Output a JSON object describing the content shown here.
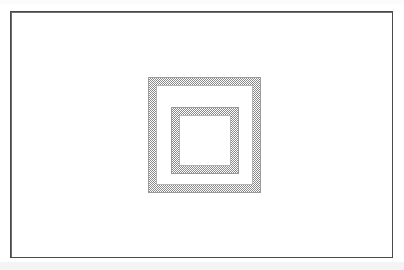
{
  "figure": {
    "title": "",
    "caption": "",
    "background_color": "#ffffff",
    "canvas": {
      "width": 404,
      "height": 270
    }
  },
  "frame": {
    "name": "figure-border",
    "x": 10,
    "y": 11,
    "width": 383,
    "height": 247,
    "stroke_color": "#4a4a4a",
    "stroke_width": 1,
    "fill_color": "#ffffff"
  },
  "artifacts": {
    "top_band_color": "#fbfbfb",
    "bottom_band_color": "#f4f4f4"
  },
  "shapes": [
    {
      "name": "outer-square",
      "type": "square-ring",
      "x": 148,
      "y": 77,
      "width": 113,
      "height": 116,
      "border_thickness": 7,
      "fill_pattern": "dithered-gray-halftone",
      "fill_color": "#8a8a8a",
      "stroke_color": "#9a9a9a",
      "interior_fill": "#ffffff"
    },
    {
      "name": "inner-square",
      "type": "square-ring",
      "x": 171,
      "y": 107,
      "width": 68,
      "height": 67,
      "border_thickness": 7,
      "fill_pattern": "dithered-gray-halftone",
      "fill_color": "#8a8a8a",
      "stroke_color": "#9a9a9a",
      "interior_fill": "#ffffff"
    }
  ],
  "chart_data": {
    "type": "diagram",
    "title": "",
    "shape_count": 2,
    "shapes": [
      {
        "label": "outer-square",
        "side_px": 113,
        "ring_thickness_px": 7,
        "center_x": 204,
        "center_y": 135
      },
      {
        "label": "inner-square",
        "side_px": 68,
        "ring_thickness_px": 7,
        "center_x": 205,
        "center_y": 140
      }
    ],
    "xlabel": "",
    "ylabel": "",
    "legend": []
  }
}
